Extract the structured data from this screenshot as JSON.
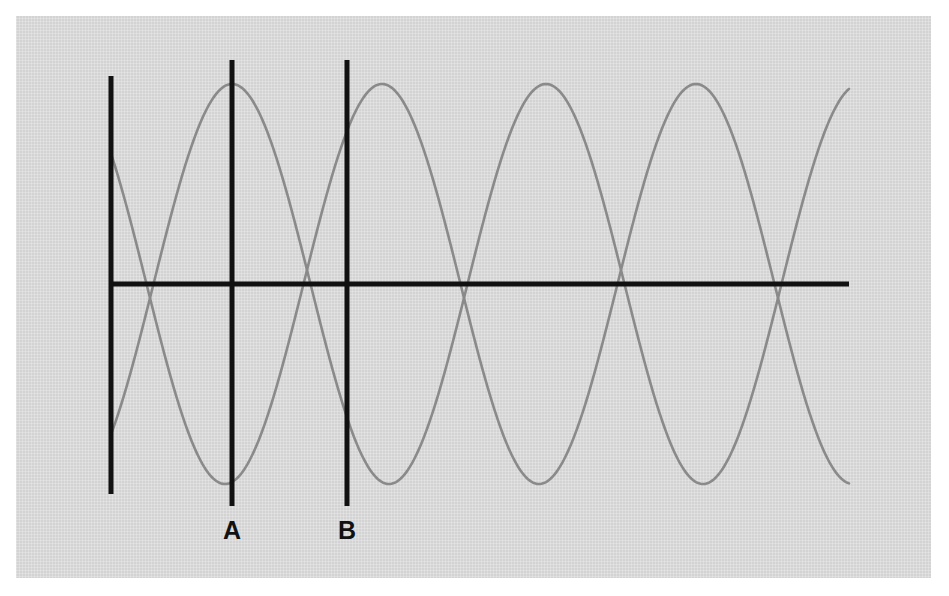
{
  "figure": {
    "kind": "line",
    "background_color": "#d3d3d3",
    "outer_color": "#ffffff",
    "axis_color": "#111111",
    "curve_color": "#8a8a8a",
    "marker_line_color": "#111111"
  },
  "labels": {
    "marker_a": "A",
    "marker_b": "B"
  },
  "chart_data": {
    "type": "line",
    "title": "",
    "xlabel": "",
    "ylabel": "",
    "grid": false,
    "legend": "none",
    "axes": {
      "x_axis": {
        "y_px": 284,
        "x_start_px": 111,
        "x_end_px": 849
      },
      "y_axis": {
        "x_px": 111,
        "y_top_px": 76,
        "y_bottom_px": 494
      }
    },
    "annotations": [
      {
        "label": "A",
        "type": "vertical-line",
        "x_px": 232,
        "y_top_px": 60,
        "y_bottom_px": 506,
        "label_y_px": 518
      },
      {
        "label": "B",
        "type": "vertical-line",
        "x_px": 347,
        "y_top_px": 60,
        "y_bottom_px": 506,
        "label_y_px": 518
      }
    ],
    "series": [
      {
        "name": "wave-1",
        "color": "#8a8a8a",
        "waveform": "cosine",
        "amplitude_px": 200,
        "period_px": 314,
        "peak_x_px": 232,
        "baseline_y_px": 284,
        "x_start_px": 111,
        "x_end_px": 850,
        "peaks_x_px": [
          232,
          546,
          860
        ],
        "troughs_x_px": [
          75,
          389,
          703
        ],
        "zero_crossings_x_px": [
          153,
          311,
          467,
          625,
          781
        ]
      },
      {
        "name": "wave-2",
        "color": "#8a8a8a",
        "waveform": "cosine",
        "amplitude_px": 200,
        "period_px": 314,
        "peak_x_px": 382,
        "baseline_y_px": 284,
        "x_start_px": 111,
        "x_end_px": 850,
        "peaks_x_px": [
          68,
          382,
          697
        ],
        "troughs_x_px": [
          225,
          539,
          853
        ],
        "zero_crossings_x_px": [
          146,
          304,
          461,
          618,
          775
        ]
      }
    ]
  }
}
